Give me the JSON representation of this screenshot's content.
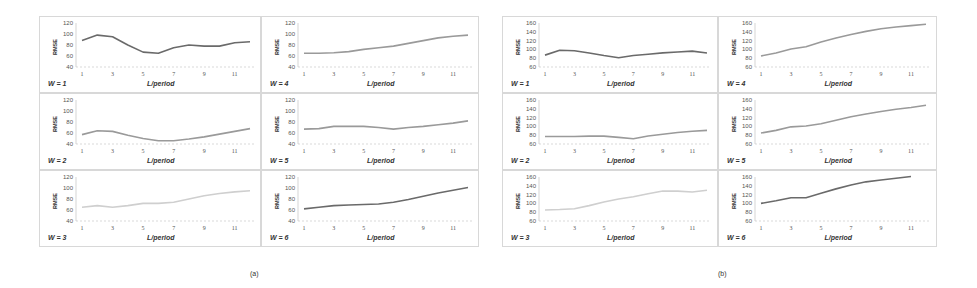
{
  "captions": {
    "a": "(a)",
    "b": "(b)"
  },
  "colors": {
    "line_dark": "#6a6a6a",
    "line_mid": "#9a9a9a",
    "line_light": "#cfcfcf",
    "grid": "#c8c8c8",
    "border": "#d8d8d8"
  },
  "chart_data": [
    {
      "group": "(a)",
      "type": "line",
      "xlabel": "L/period",
      "ylabel": "RMSE",
      "ylim": [
        40,
        120
      ],
      "yticks": [
        40,
        60,
        80,
        100,
        120
      ],
      "xticks": [
        1,
        3,
        5,
        7,
        9,
        11
      ],
      "x": [
        1,
        2,
        3,
        4,
        5,
        6,
        7,
        8,
        9,
        10,
        11,
        12
      ],
      "series": [
        {
          "name": "W = 1",
          "values": [
            88,
            98,
            95,
            80,
            67,
            65,
            75,
            80,
            78,
            78,
            84,
            86
          ]
        },
        {
          "name": "W = 2",
          "values": [
            57,
            64,
            63,
            56,
            50,
            46,
            46,
            49,
            53,
            58,
            63,
            68
          ]
        },
        {
          "name": "W = 3",
          "values": [
            65,
            68,
            65,
            68,
            72,
            72,
            74,
            80,
            86,
            90,
            93,
            95
          ]
        },
        {
          "name": "W = 4",
          "values": [
            65,
            65,
            66,
            68,
            72,
            75,
            78,
            83,
            88,
            93,
            96,
            98
          ]
        },
        {
          "name": "W = 5",
          "values": [
            67,
            68,
            72,
            72,
            72,
            70,
            67,
            70,
            72,
            75,
            78,
            82
          ]
        },
        {
          "name": "W = 6",
          "values": [
            62,
            65,
            68,
            69,
            70,
            71,
            74,
            79,
            85,
            91,
            96,
            101
          ]
        }
      ]
    },
    {
      "group": "(b)",
      "type": "line",
      "xlabel": "L/period",
      "ylabel": "RMSE",
      "ylim": [
        60,
        160
      ],
      "yticks": [
        60,
        80,
        100,
        120,
        140,
        160
      ],
      "xticks": [
        1,
        3,
        5,
        7,
        9,
        11
      ],
      "x": [
        1,
        2,
        3,
        4,
        5,
        6,
        7,
        8,
        9,
        10,
        11,
        12
      ],
      "series": [
        {
          "name": "W = 1",
          "values": [
            87,
            98,
            97,
            92,
            86,
            81,
            86,
            89,
            92,
            94,
            96,
            92
          ]
        },
        {
          "name": "W = 2",
          "values": [
            77,
            77,
            77,
            78,
            78,
            75,
            72,
            78,
            82,
            86,
            89,
            91
          ]
        },
        {
          "name": "W = 3",
          "values": [
            85,
            86,
            88,
            95,
            103,
            110,
            115,
            122,
            128,
            128,
            126,
            130
          ]
        },
        {
          "name": "W = 4",
          "values": [
            85,
            92,
            101,
            106,
            117,
            126,
            134,
            141,
            147,
            151,
            154,
            157
          ]
        },
        {
          "name": "W = 5",
          "values": [
            85,
            91,
            99,
            101,
            106,
            114,
            122,
            128,
            134,
            139,
            143,
            148
          ]
        },
        {
          "name": "W = 6",
          "values": [
            100,
            106,
            113,
            113,
            123,
            133,
            142,
            149,
            153,
            157,
            161
          ]
        }
      ]
    }
  ]
}
